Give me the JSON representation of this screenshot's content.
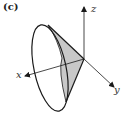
{
  "figure": {
    "panel_label": "(c)",
    "axes": {
      "x": {
        "label": "x"
      },
      "y": {
        "label": "y"
      },
      "z": {
        "label": "z"
      }
    },
    "shape": "cone with elliptical base, shaded triangular cross-section",
    "colors": {
      "stroke": "#1a1a1a",
      "shade": "#c8c8c8",
      "background": "#ffffff"
    }
  }
}
